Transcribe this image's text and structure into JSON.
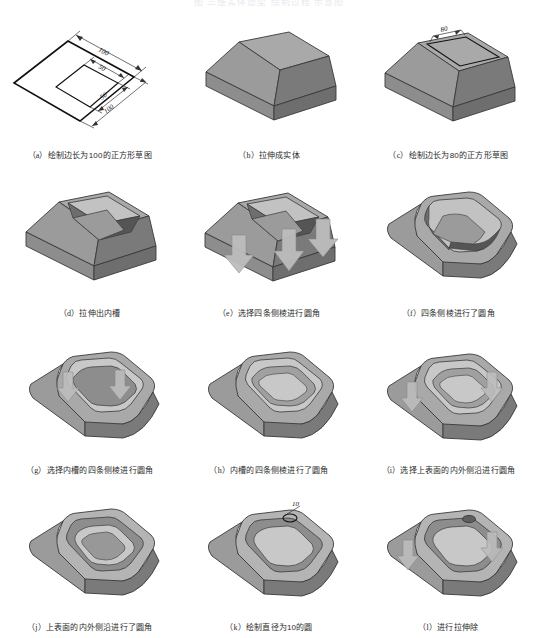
{
  "page": {
    "header_faint_text": "图 三维实体造型 绘制过程 示意图",
    "background": "#ffffff",
    "columns": 3,
    "rows": 4
  },
  "palette": {
    "top_face": "#a9a9a9",
    "left_face": "#9b9b9b",
    "right_face": "#7a7a7a",
    "inner_dark": "#6e6e6e",
    "inner_mid": "#8d8d8d",
    "highlight": "#c2c2c2",
    "outline": "#3a3a3a",
    "sketch_line": "#111111",
    "dim_line": "#333333",
    "preview_fill": "#b9b9b9"
  },
  "figures": [
    {
      "key": "a",
      "index_label": "（a）",
      "caption": "绘制边长为100的正方形草图",
      "type": "sketch-square-dimensioned",
      "dimensions": [
        "100",
        "50",
        "50",
        "100"
      ]
    },
    {
      "key": "b",
      "index_label": "（b）",
      "caption": "拉伸成实体",
      "type": "solid-frustum",
      "dimensions": []
    },
    {
      "key": "c",
      "index_label": "（c）",
      "caption": "绘制边长为80的正方形草图",
      "type": "frustum-with-top-sketch",
      "dimensions": [
        "80"
      ]
    },
    {
      "key": "d",
      "index_label": "（d）",
      "caption": "拉伸出内槽",
      "type": "frustum-pocket",
      "dimensions": []
    },
    {
      "key": "e",
      "index_label": "（e）",
      "caption": "选择四条侧棱进行圆角",
      "type": "pocket-select-outer-edges",
      "dimensions": []
    },
    {
      "key": "f",
      "index_label": "（f）",
      "caption": "四条侧棱进行了圆角",
      "type": "pocket-outer-filleted",
      "dimensions": []
    },
    {
      "key": "g",
      "index_label": "（g）",
      "caption": "选择内槽的四条侧棱进行圆角",
      "type": "select-inner-edges",
      "dimensions": []
    },
    {
      "key": "h",
      "index_label": "（h）",
      "caption": "内槽的四条侧棱进行了圆角",
      "type": "inner-filleted",
      "dimensions": []
    },
    {
      "key": "i",
      "index_label": "（i）",
      "caption": "选择上表面的内外侧沿进行圆角",
      "type": "select-top-rims",
      "dimensions": []
    },
    {
      "key": "j",
      "index_label": "（j）",
      "caption": "上表面的内外侧沿进行了圆角",
      "type": "top-rims-filleted",
      "dimensions": []
    },
    {
      "key": "k",
      "index_label": "（k）",
      "caption": "绘制直径为10的圆",
      "type": "sketch-circle-on-rim",
      "dimensions": [
        "10"
      ]
    },
    {
      "key": "l",
      "index_label": "（l）",
      "caption": "进行拉伸除",
      "type": "extrude-cut-hole",
      "dimensions": []
    }
  ]
}
